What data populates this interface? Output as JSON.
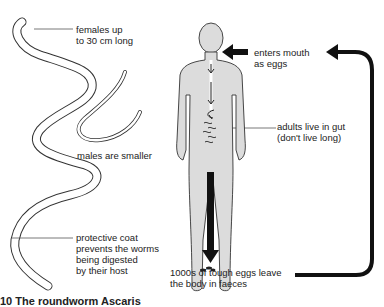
{
  "labels": {
    "females": [
      "females up",
      "to 30 cm long"
    ],
    "males": [
      "males are smaller"
    ],
    "coat": [
      "protective coat",
      "prevents the worms",
      "being digested",
      "by their host"
    ],
    "mouth": [
      "enters mouth",
      "as eggs"
    ],
    "gut": [
      "adults live in gut",
      "(don't live long)"
    ],
    "eggs": [
      "1000s of tough eggs leave",
      "the body in faeces"
    ]
  },
  "caption": "10 The roundworm Ascaris",
  "colors": {
    "arrow": "#111111",
    "body_fill": "#dcdcdc",
    "outline": "#333333"
  }
}
